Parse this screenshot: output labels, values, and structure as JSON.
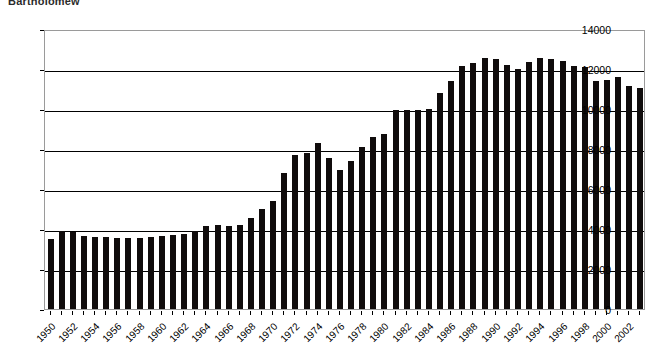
{
  "title_clipped": "Bartholomew",
  "axes": {
    "y_ticks": [
      0,
      2000,
      4000,
      6000,
      8000,
      10000,
      12000,
      14000
    ],
    "y_min": 0,
    "y_max": 14000,
    "y_label": "",
    "x_label": "",
    "x_tick_step": 2
  },
  "colors": {
    "bar": "#100c0c",
    "gridline": "#000000",
    "frame": "#9a9a9a",
    "background": "#ffffff"
  },
  "chart_data": {
    "type": "bar",
    "title": "Bartholomew",
    "xlabel": "",
    "ylabel": "",
    "ylim": [
      0,
      14000
    ],
    "grid": true,
    "legend": "none",
    "categories": [
      "1950",
      "1951",
      "1952",
      "1953",
      "1954",
      "1955",
      "1956",
      "1957",
      "1958",
      "1959",
      "1960",
      "1961",
      "1962",
      "1963",
      "1964",
      "1965",
      "1966",
      "1967",
      "1968",
      "1969",
      "1970",
      "1971",
      "1972",
      "1973",
      "1974",
      "1975",
      "1976",
      "1977",
      "1978",
      "1979",
      "1980",
      "1981",
      "1982",
      "1983",
      "1984",
      "1985",
      "1986",
      "1987",
      "1988",
      "1989",
      "1990",
      "1991",
      "1992",
      "1993",
      "1994",
      "1995",
      "1996",
      "1997",
      "1998",
      "1999",
      "2000",
      "2001",
      "2002",
      "2003"
    ],
    "tick_labels": [
      "1950",
      "1952",
      "1954",
      "1956",
      "1958",
      "1960",
      "1962",
      "1964",
      "1966",
      "1968",
      "1970",
      "1972",
      "1974",
      "1976",
      "1978",
      "1980",
      "1982",
      "1984",
      "1986",
      "1988",
      "1990",
      "1992",
      "1994",
      "1996",
      "1998",
      "2000",
      "2002"
    ],
    "values": [
      3500,
      3900,
      3850,
      3650,
      3600,
      3600,
      3550,
      3550,
      3550,
      3600,
      3650,
      3700,
      3750,
      3900,
      4150,
      4200,
      4150,
      4200,
      4550,
      5000,
      5400,
      6800,
      7700,
      7800,
      8300,
      7550,
      6950,
      7400,
      8100,
      8600,
      8750,
      9950,
      9950,
      9950,
      10000,
      10800,
      11400,
      12150,
      12300,
      12550,
      12500,
      12200,
      12000,
      12350,
      12550,
      12500,
      12400,
      12150,
      12100,
      11400,
      11450,
      11600,
      11150,
      11050
    ]
  }
}
